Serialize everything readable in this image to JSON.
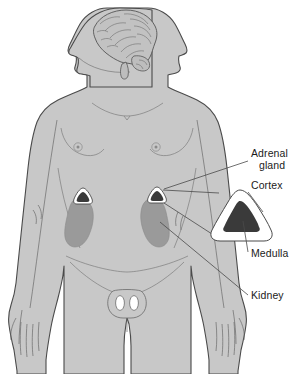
{
  "figure": {
    "background_color": "#ffffff"
  },
  "labels": [
    {
      "id": "adrenal-gland",
      "line1": "Adrenal",
      "line2": "gland",
      "x": 251,
      "y": 157
    },
    {
      "id": "cortex",
      "line1": "Cortex",
      "line2": "",
      "x": 251,
      "y": 189
    },
    {
      "id": "medulla",
      "line1": "Medulla",
      "line2": "",
      "x": 251,
      "y": 257
    },
    {
      "id": "kidney",
      "line1": "Kidney",
      "line2": "",
      "x": 251,
      "y": 299
    }
  ],
  "colors": {
    "body_fill": "#c8c8c8",
    "body_outline": "#4a4a4a",
    "kidney_fill": "#9a9a9a",
    "adrenal_cortex": "#ffffff",
    "adrenal_medulla": "#3a3a3a",
    "brain_fill": "#c0c0c0",
    "brain_outline": "#555555",
    "leader_line": "#4a4a4a",
    "text": "#1b1b1b"
  },
  "anatomy": {
    "head": {
      "label": "head-profile",
      "facing": "left"
    },
    "brain": {
      "label": "brain"
    },
    "kidney_left": {
      "label": "kidney-left",
      "cx": 80,
      "cy": 222
    },
    "kidney_right": {
      "label": "kidney-right",
      "cx": 156,
      "cy": 222
    },
    "adrenal_left": {
      "label": "adrenal-gland-left",
      "cx": 83,
      "cy": 198
    },
    "adrenal_right": {
      "label": "adrenal-gland-right",
      "cx": 157,
      "cy": 197
    },
    "inset": {
      "label": "adrenal-gland-inset-cross-section",
      "cx": 240,
      "cy": 215
    }
  }
}
